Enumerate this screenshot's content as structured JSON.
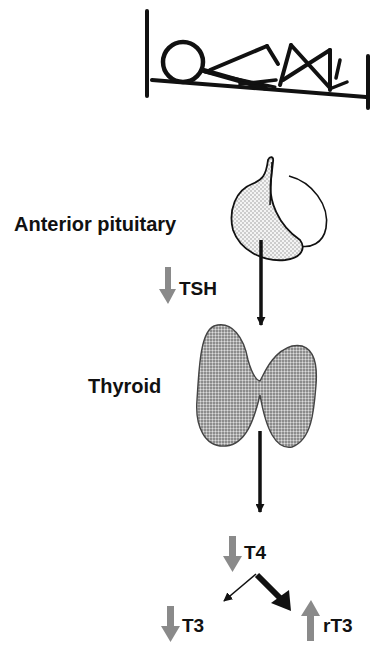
{
  "diagram": {
    "type": "physiology-flow",
    "colors": {
      "ink": "#111111",
      "down_up_arrow": "#8a8a8a",
      "pituitary_fill": "#e2e2e2",
      "thyroid_fill": "#9a9a9a",
      "background": "#ffffff"
    },
    "patient": {
      "icon": "patient-lying-in-bed-icon"
    },
    "organs": [
      {
        "id": "pituitary",
        "label": "Anterior pituitary"
      },
      {
        "id": "thyroid",
        "label": "Thyroid"
      }
    ],
    "hormones": [
      {
        "id": "tsh",
        "label": "TSH",
        "direction": "down"
      },
      {
        "id": "t4",
        "label": "T4",
        "direction": "down"
      },
      {
        "id": "t3",
        "label": "T3",
        "direction": "down"
      },
      {
        "id": "rt3",
        "label": "rT3",
        "direction": "up"
      }
    ],
    "flows": [
      {
        "from": "pituitary",
        "to": "thyroid",
        "style": "thin-black-arrow"
      },
      {
        "from": "thyroid",
        "to": "t4",
        "style": "thin-black-arrow"
      },
      {
        "from": "t4",
        "to": "t3",
        "style": "thin-black-arrow"
      },
      {
        "from": "t4",
        "to": "rt3",
        "style": "thick-black-arrow"
      }
    ]
  }
}
